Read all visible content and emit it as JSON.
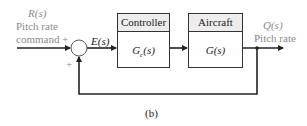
{
  "diagram": {
    "input": {
      "signal": "R(s)",
      "line1": "Pitch rate",
      "line2": "command",
      "sign": "+"
    },
    "summing_junction": {
      "feedback_sign": "+"
    },
    "error_signal": "E(s)",
    "blocks": [
      {
        "title": "Controller",
        "transfer": "Gc(s)",
        "transfer_main": "G",
        "transfer_sub": "c",
        "transfer_arg": "(s)"
      },
      {
        "title": "Aircraft",
        "transfer": "G(s)"
      }
    ],
    "output": {
      "signal": "Q(s)",
      "label": "Pitch rate"
    },
    "caption": "(b)",
    "colors": {
      "line": "#222222",
      "label_gray": "#8a8a8a",
      "header_bg": "#ededed"
    }
  }
}
